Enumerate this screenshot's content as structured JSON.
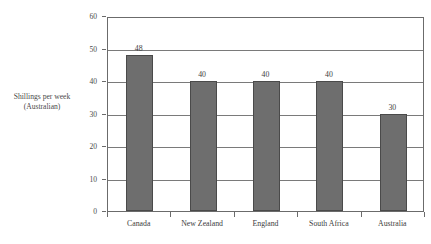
{
  "chart_data": {
    "type": "bar",
    "title": "",
    "categories": [
      "Canada",
      "New Zealand",
      "England",
      "South Africa",
      "Australia"
    ],
    "values": [
      48,
      40,
      40,
      40,
      30
    ],
    "data_labels": [
      "48",
      "40",
      "40",
      "40",
      "30"
    ],
    "xlabel": "",
    "ylabel": "Shillings per week (Australian)",
    "ylabel_lines": [
      "Shillings per week",
      "(Australian)"
    ],
    "ylim": [
      0,
      60
    ],
    "ytick_labels": [
      "0",
      "10",
      "20",
      "30",
      "40",
      "50",
      "60"
    ],
    "ytick_values": [
      0,
      10,
      20,
      30,
      40,
      50,
      60
    ],
    "grid": true,
    "grid_axis": "y",
    "legend": false,
    "bar_color": "#6e6e6e",
    "bar_edge_color": "#4a4a4a",
    "frame_color": "#6b6b6b",
    "text_color": "#3d3d3d",
    "background": "#ffffff"
  },
  "figure": {
    "title_cutoff": "",
    "caption_line1": "Shillings per week",
    "caption_line2": "(Australian)"
  }
}
